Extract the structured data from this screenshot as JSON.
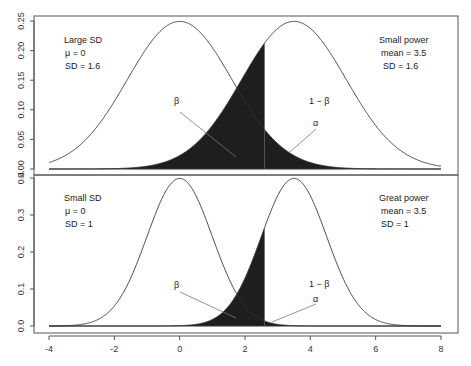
{
  "chart_data": [
    {
      "type": "line",
      "panel": "top",
      "title": "",
      "xlabel": "",
      "ylabel": "",
      "xlim": [
        -4,
        8
      ],
      "ylim": [
        0,
        0.25
      ],
      "yticks": [
        "0.00",
        "0.05",
        "0.10",
        "0.15",
        "0.20",
        "0.25"
      ],
      "ytick_values": [
        0,
        0.05,
        0.1,
        0.15,
        0.2,
        0.25
      ],
      "series": [
        {
          "name": "H0",
          "distribution": "normal",
          "mean": 0,
          "sd": 1.6
        },
        {
          "name": "H1",
          "distribution": "normal",
          "mean": 3.5,
          "sd": 1.6
        }
      ],
      "critical_value": 2.6,
      "shaded": [
        "beta (H1 left of critical value)",
        "alpha (H0 right of critical value)"
      ],
      "annotations": {
        "left": [
          "Large SD",
          "μ = 0",
          "SD = 1.6"
        ],
        "right": [
          "Small power",
          "mean = 3.5",
          "SD = 1.6"
        ],
        "beta": "β",
        "one_minus_beta": "1 − β",
        "alpha": "α"
      }
    },
    {
      "type": "line",
      "panel": "bottom",
      "title": "",
      "xlabel": "",
      "ylabel": "",
      "xlim": [
        -4,
        8
      ],
      "ylim": [
        0,
        0.4
      ],
      "xticks": [
        "-4",
        "-2",
        "0",
        "2",
        "4",
        "6",
        "8"
      ],
      "xtick_values": [
        -4,
        -2,
        0,
        2,
        4,
        6,
        8
      ],
      "yticks": [
        "0.0",
        "0.1",
        "0.2",
        "0.3",
        "0.4"
      ],
      "ytick_values": [
        0,
        0.1,
        0.2,
        0.3,
        0.4
      ],
      "series": [
        {
          "name": "H0",
          "distribution": "normal",
          "mean": 0,
          "sd": 1
        },
        {
          "name": "H1",
          "distribution": "normal",
          "mean": 3.5,
          "sd": 1
        }
      ],
      "critical_value": 2.6,
      "shaded": [
        "beta (H1 left of critical value)",
        "alpha (H0 right of critical value)"
      ],
      "annotations": {
        "left": [
          "Small SD",
          "μ = 0",
          "SD = 1"
        ],
        "right": [
          "Great power",
          "mean = 3.5",
          "SD = 1"
        ],
        "beta": "β",
        "one_minus_beta": "1 − β",
        "alpha": "α"
      }
    }
  ]
}
